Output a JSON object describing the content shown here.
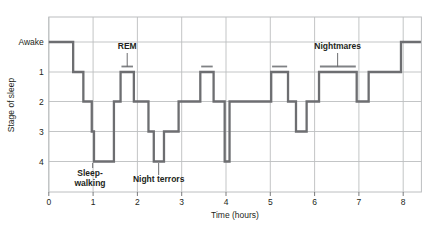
{
  "chart_data": {
    "type": "line",
    "title": "",
    "xlabel": "Time (hours)",
    "ylabel": "Stage of sleep",
    "xlim": [
      -0.1,
      8.4
    ],
    "ylim_categories": [
      "Awake",
      "1",
      "2",
      "3",
      "4"
    ],
    "xticks": [
      0,
      1,
      2,
      3,
      4,
      5,
      6,
      7,
      8
    ],
    "xtick_labels": [
      "0",
      "1",
      "2",
      "3",
      "4",
      "5",
      "6",
      "7",
      "8"
    ],
    "yticks": [
      "Awake",
      "1",
      "2",
      "3",
      "4"
    ],
    "ytick_labels": [
      "Awake",
      "1",
      "2",
      "3",
      "4"
    ],
    "grid": true,
    "line_color": "#6d6e71",
    "grid_color": "#bcbec0",
    "text_color": "#231f20",
    "series": [
      {
        "name": "Sleep stage",
        "step_type": "post",
        "points": [
          [
            0.0,
            "Awake"
          ],
          [
            0.55,
            "Awake"
          ],
          [
            0.55,
            "1"
          ],
          [
            0.78,
            "1"
          ],
          [
            0.78,
            "2"
          ],
          [
            0.97,
            "2"
          ],
          [
            0.97,
            "3"
          ],
          [
            1.02,
            "3"
          ],
          [
            1.02,
            "4"
          ],
          [
            1.47,
            "4"
          ],
          [
            1.47,
            "2"
          ],
          [
            1.62,
            "2"
          ],
          [
            1.62,
            "1"
          ],
          [
            1.92,
            "1"
          ],
          [
            1.92,
            "2"
          ],
          [
            2.25,
            "2"
          ],
          [
            2.25,
            "3"
          ],
          [
            2.37,
            "3"
          ],
          [
            2.37,
            "4"
          ],
          [
            2.6,
            "4"
          ],
          [
            2.6,
            "3"
          ],
          [
            2.93,
            "3"
          ],
          [
            2.93,
            "2"
          ],
          [
            3.42,
            "2"
          ],
          [
            3.42,
            "1"
          ],
          [
            3.72,
            "1"
          ],
          [
            3.72,
            "2"
          ],
          [
            3.97,
            "2"
          ],
          [
            3.97,
            "4"
          ],
          [
            4.08,
            "4"
          ],
          [
            4.08,
            "2"
          ],
          [
            5.02,
            "2"
          ],
          [
            5.02,
            "1"
          ],
          [
            5.4,
            "1"
          ],
          [
            5.4,
            "2"
          ],
          [
            5.58,
            "2"
          ],
          [
            5.58,
            "3"
          ],
          [
            5.82,
            "3"
          ],
          [
            5.82,
            "2"
          ],
          [
            6.1,
            "2"
          ],
          [
            6.1,
            "1"
          ],
          [
            6.95,
            "1"
          ],
          [
            6.95,
            "2"
          ],
          [
            7.22,
            "2"
          ],
          [
            7.22,
            "1"
          ],
          [
            7.95,
            "1"
          ],
          [
            7.95,
            "Awake"
          ],
          [
            8.4,
            "Awake"
          ]
        ]
      }
    ],
    "rem_markers": [
      {
        "x_start": 1.64,
        "x_end": 1.9,
        "stage": "1"
      },
      {
        "x_start": 3.44,
        "x_end": 3.7,
        "stage": "1"
      },
      {
        "x_start": 5.04,
        "x_end": 5.38,
        "stage": "1"
      },
      {
        "x_start": 6.12,
        "x_end": 6.93,
        "stage": "1"
      }
    ],
    "annotations": [
      {
        "label": "REM",
        "text_x": 1.77,
        "text_y_px": 49,
        "leader_x": 1.77,
        "leader_y1_px": 53,
        "leader_y2_px": 67,
        "anchor": "middle"
      },
      {
        "label": "Nightmares",
        "text_x": 6.52,
        "text_y_px": 49,
        "leader_x": 6.52,
        "leader_y1_px": 53,
        "leader_y2_px": 67,
        "anchor": "middle"
      },
      {
        "label": "Sleep-",
        "label2": "walking",
        "text_x": 0.93,
        "text_y_px": 176,
        "leader_x": 0.99,
        "leader_y1_px": 163,
        "leader_y2_px": 168,
        "anchor": "middle"
      },
      {
        "label": "Night terrors",
        "text_x": 2.48,
        "text_y_px": 182,
        "leader_x": 2.48,
        "leader_y1_px": 163,
        "leader_y2_px": 175,
        "anchor": "middle"
      }
    ]
  },
  "axes": {
    "y_title": "Stage of sleep",
    "x_title": "Time (hours)"
  }
}
